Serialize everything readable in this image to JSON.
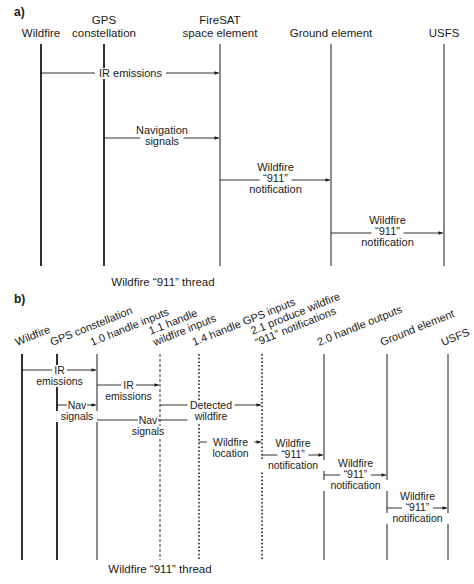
{
  "part_a": {
    "label": "a)",
    "caption": "Wildfire “911” thread",
    "lifelines": [
      {
        "lines": [
          "Wildfire"
        ],
        "style": "solid-thick"
      },
      {
        "lines": [
          "GPS",
          "constellation"
        ],
        "style": "solid-thick"
      },
      {
        "lines": [
          "FireSAT",
          "space element"
        ],
        "style": "solid"
      },
      {
        "lines": [
          "Ground element"
        ],
        "style": "solid"
      },
      {
        "lines": [
          "USFS"
        ],
        "style": "solid"
      }
    ],
    "messages": [
      {
        "from": 0,
        "to": 2,
        "lines": [
          "IR emissions"
        ],
        "label_pos": "inline"
      },
      {
        "from": 1,
        "to": 2,
        "lines": [
          "Navigation",
          "signals"
        ],
        "label_pos": "split"
      },
      {
        "from": 2,
        "to": 3,
        "lines": [
          "Wildfire",
          "“911”",
          "notification"
        ],
        "label_pos": "middle"
      },
      {
        "from": 3,
        "to": 4,
        "lines": [
          "Wildfire",
          "“911”",
          "notification"
        ],
        "label_pos": "middle"
      }
    ]
  },
  "part_b": {
    "label": "b)",
    "caption": "Wildfire “911” thread",
    "lifelines": [
      {
        "lines": [
          "Wildfire"
        ],
        "style": "solid-thick"
      },
      {
        "lines": [
          "GPS constellation"
        ],
        "style": "solid-thick"
      },
      {
        "lines": [
          "1.0 handle inputs"
        ],
        "style": "solid"
      },
      {
        "lines": [
          "1.1 handle",
          "wildfire inputs"
        ],
        "style": "dashed"
      },
      {
        "lines": [
          "1.4 handle GPS inputs"
        ],
        "style": "dotted"
      },
      {
        "lines": [
          "2.1 produce wildfire",
          "“911” notifications"
        ],
        "style": "dotted"
      },
      {
        "lines": [
          "2.0 handle outputs"
        ],
        "style": "solid"
      },
      {
        "lines": [
          "Ground element"
        ],
        "style": "solid"
      },
      {
        "lines": [
          "USFS"
        ],
        "style": "solid"
      }
    ],
    "messages": [
      {
        "from": 0,
        "to": 2,
        "lines": [
          "IR",
          "emissions"
        ]
      },
      {
        "from": 1,
        "to": 2,
        "lines": [
          "Nav",
          "signals"
        ]
      },
      {
        "from": 2,
        "to": 3,
        "lines": [
          "IR",
          "emissions"
        ]
      },
      {
        "from": 2,
        "to": 4,
        "lines": [
          "Nav",
          "signals"
        ]
      },
      {
        "from": 3,
        "to": 5,
        "lines": [
          "Detected",
          "wildfire"
        ]
      },
      {
        "from": 4,
        "to": 5,
        "lines": [
          "Wildfire",
          "location"
        ]
      },
      {
        "from": 5,
        "to": 6,
        "lines": [
          "Wildfire",
          "“911”",
          "notification"
        ]
      },
      {
        "from": 6,
        "to": 7,
        "lines": [
          "Wildfire",
          "“911”",
          "notification"
        ]
      },
      {
        "from": 7,
        "to": 8,
        "lines": [
          "Wildfire",
          "“911”",
          "notification"
        ]
      }
    ]
  }
}
